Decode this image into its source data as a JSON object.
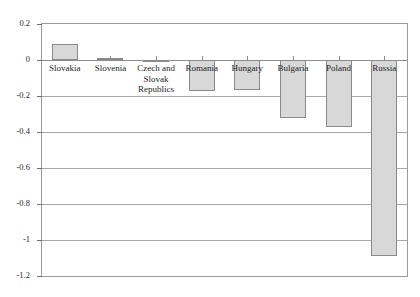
{
  "chart_data": {
    "type": "bar",
    "title": "",
    "subtitle": "",
    "xlabel": "",
    "ylabel": "",
    "categories": [
      "Slovakia",
      "Slovenia",
      "Czech and\nSlovak\nRepublics",
      "Romania",
      "Hungary",
      "Bulgaria",
      "Poland",
      "Russia"
    ],
    "values": [
      0.09,
      0.01,
      -0.01,
      -0.17,
      -0.165,
      -0.32,
      -0.37,
      -1.09
    ],
    "ylim": [
      -1.2,
      0.2
    ],
    "yticks": [
      0.2,
      0,
      -0.2,
      -0.4,
      -0.6,
      -0.8,
      -1,
      -1.2
    ],
    "ytick_labels": [
      "0.2",
      "0",
      "-0.2",
      "-0.4",
      "-0.6",
      "-0.8",
      "-1",
      "-1.2"
    ],
    "grid": true,
    "legend": false,
    "bar_fill_color": "#d8d8d8",
    "bar_edge_color": "#8a8a8a",
    "gridline_color": "#a8a8a8",
    "frame_color": "#9a9a9a",
    "background_color": "#ffffff"
  }
}
